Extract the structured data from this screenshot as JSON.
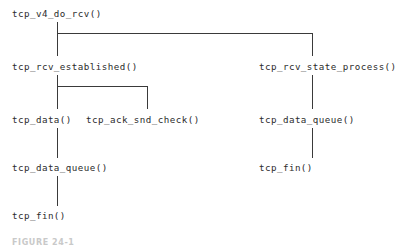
{
  "diagram": {
    "type": "call-graph",
    "line_color": "#3a3a3a",
    "text_color": "#2b2b2b",
    "background_color": "#ffffff",
    "nodes": [
      {
        "id": "tcp_v4_do_rcv",
        "label": "tcp_v4_do_rcv()",
        "level": 0,
        "column": "left"
      },
      {
        "id": "tcp_rcv_established",
        "label": "tcp_rcv_established()",
        "level": 1,
        "column": "left"
      },
      {
        "id": "tcp_rcv_state_process",
        "label": "tcp_rcv_state_process()",
        "level": 1,
        "column": "right"
      },
      {
        "id": "tcp_data",
        "label": "tcp_data()",
        "level": 2,
        "column": "left"
      },
      {
        "id": "tcp_ack_snd_check",
        "label": "tcp_ack_snd_check()",
        "level": 2,
        "column": "left-branch"
      },
      {
        "id": "tcp_data_queue_right",
        "label": "tcp_data_queue()",
        "level": 2,
        "column": "right"
      },
      {
        "id": "tcp_data_queue_left",
        "label": "tcp_data_queue()",
        "level": 3,
        "column": "left"
      },
      {
        "id": "tcp_fin_right",
        "label": "tcp_fin()",
        "level": 3,
        "column": "right"
      },
      {
        "id": "tcp_fin_left",
        "label": "tcp_fin()",
        "level": 4,
        "column": "left"
      }
    ],
    "edges": [
      {
        "from": "tcp_v4_do_rcv",
        "to": "tcp_rcv_established",
        "shape": "vertical"
      },
      {
        "from": "tcp_v4_do_rcv",
        "to": "tcp_rcv_state_process",
        "shape": "elbow-right"
      },
      {
        "from": "tcp_rcv_established",
        "to": "tcp_data",
        "shape": "vertical"
      },
      {
        "from": "tcp_rcv_established",
        "to": "tcp_ack_snd_check",
        "shape": "elbow-right"
      },
      {
        "from": "tcp_data",
        "to": "tcp_data_queue_left",
        "shape": "vertical"
      },
      {
        "from": "tcp_data_queue_left",
        "to": "tcp_fin_left",
        "shape": "vertical"
      },
      {
        "from": "tcp_rcv_state_process",
        "to": "tcp_data_queue_right",
        "shape": "vertical"
      },
      {
        "from": "tcp_data_queue_right",
        "to": "tcp_fin_right",
        "shape": "vertical"
      }
    ],
    "caption": "FIGURE 24-1"
  }
}
